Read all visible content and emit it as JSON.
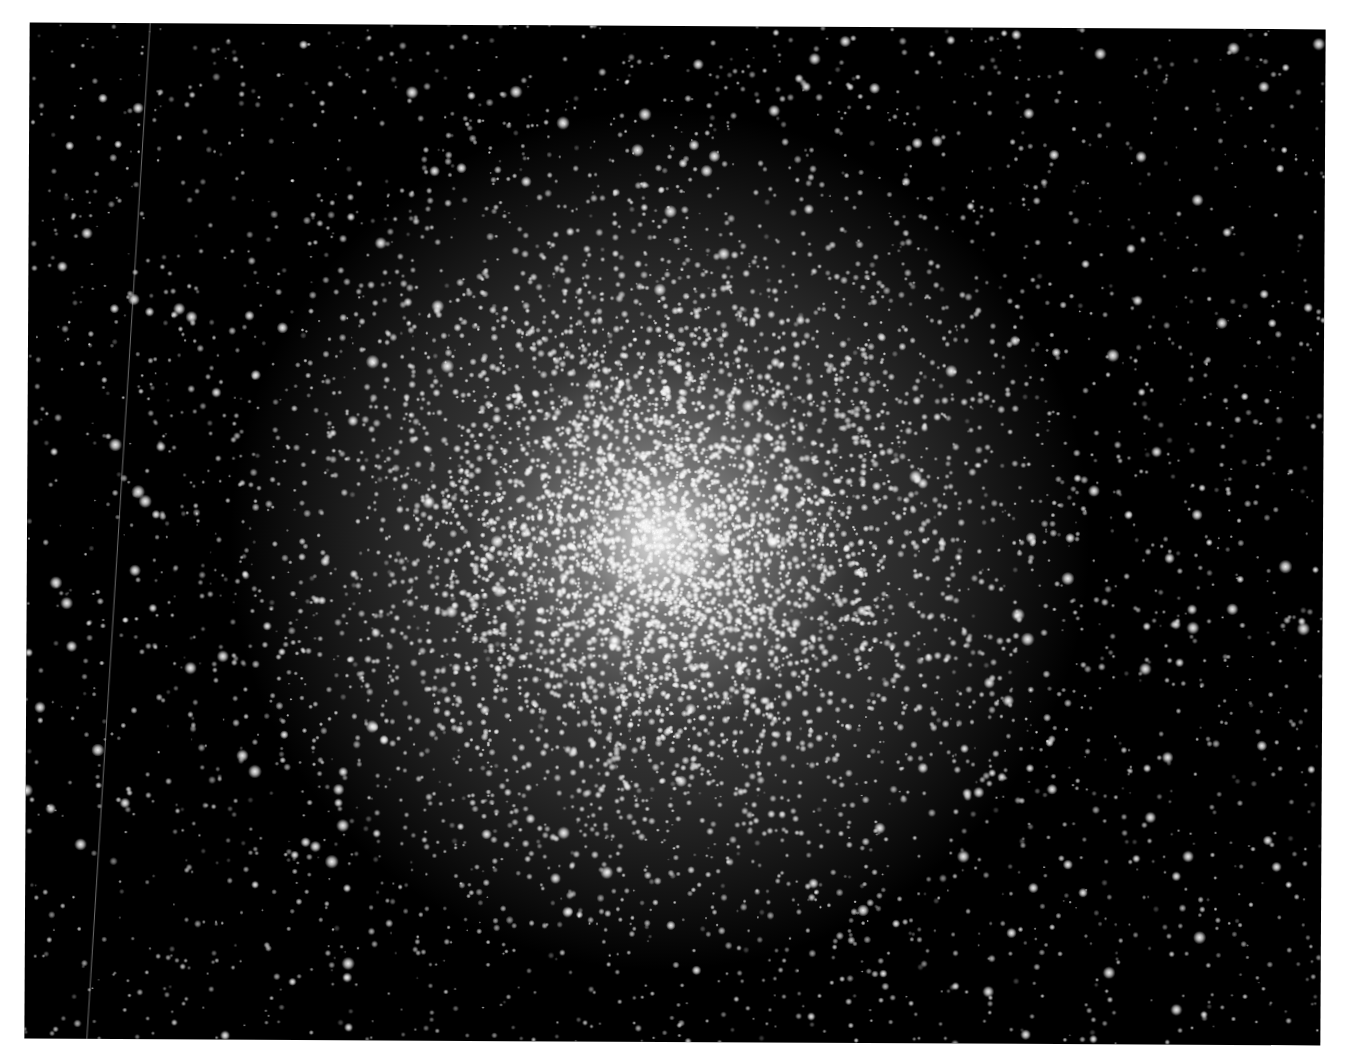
{
  "image": {
    "subject": "Globular star cluster",
    "alt_text": "Black-and-white astronomical photograph of a dense globular star cluster with a bright central core fading into a sparse field of stars",
    "background_color": "#ffffff",
    "frame_color": "#000000",
    "frame": {
      "left": 27,
      "top": 26,
      "width": 1296,
      "height": 1016,
      "rotation_deg": 0.3
    }
  },
  "cluster": {
    "center_x": 633,
    "center_y": 514,
    "core_color": "rgba(235,235,235,0.95)",
    "halo_color": "rgba(120,120,120,0.35)",
    "core_radius": 120,
    "halo_radius": 430,
    "cluster_star_count": 5200,
    "field_star_count": 2600,
    "bright_star_count": 260,
    "seed": 1337
  },
  "trail": {
    "x_top": 120,
    "x_bottom": 62,
    "color": "rgba(200,200,200,0.55)"
  }
}
